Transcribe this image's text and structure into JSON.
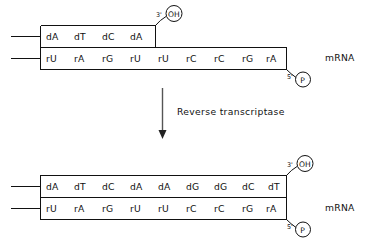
{
  "figure": {
    "background_color": "#ffffff",
    "ink_color": "#111111",
    "arrow_color": "#444444"
  },
  "panels": [
    {
      "id": "before",
      "name": "before-reverse-transcription",
      "dna_strand": {
        "name": "dna-strand-top",
        "bases": [
          "dA",
          "dT",
          "dC",
          "dA"
        ],
        "three_prime_label": "3'",
        "three_prime_group": "OH"
      },
      "rna_strand": {
        "name": "mrna-strand-bottom",
        "bases": [
          "rU",
          "rA",
          "rG",
          "rU",
          "rU",
          "rC",
          "rC",
          "rG",
          "rA"
        ],
        "five_prime_label": "5'",
        "five_prime_group": "P"
      },
      "side_label": "mRNA"
    },
    {
      "id": "after",
      "name": "after-reverse-transcription",
      "dna_strand": {
        "name": "dna-strand-top",
        "bases": [
          "dA",
          "dT",
          "dC",
          "dA",
          "dA",
          "dG",
          "dG",
          "dC",
          "dT"
        ],
        "three_prime_label": "3'",
        "three_prime_group": "OH"
      },
      "rna_strand": {
        "name": "mrna-strand-bottom",
        "bases": [
          "rU",
          "rA",
          "rG",
          "rU",
          "rU",
          "rC",
          "rC",
          "rG",
          "rA"
        ],
        "five_prime_label": "5'",
        "five_prime_group": "P"
      },
      "side_label": "mRNA"
    }
  ],
  "transition": {
    "name": "reverse-transcriptase-step",
    "enzyme_label": "Reverse transcriptase",
    "arrow_direction": "down"
  }
}
